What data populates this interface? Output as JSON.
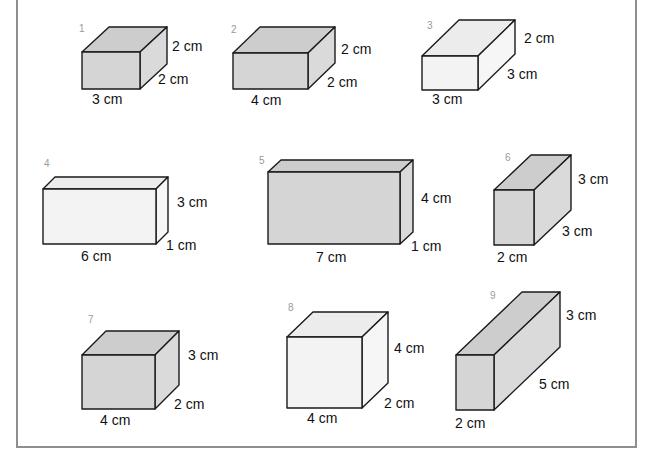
{
  "worksheet": {
    "colors": {
      "frame": "#8e8e8e",
      "edge": "#1a1a1a",
      "dark": {
        "front": "#d5d5d5",
        "top": "#cdcdcd",
        "side": "#dadada"
      },
      "light": {
        "front": "#f3f3f3",
        "top": "#ececec",
        "side": "#f6f6f6"
      }
    },
    "boxes": [
      {
        "number": "1",
        "shade": "dark",
        "front": [
          82,
          52,
          58,
          37
        ],
        "depth": [
          27,
          -25
        ],
        "num_pos": [
          79,
          32
        ],
        "labels": [
          {
            "text": "2 cm",
            "x": 172,
            "y": 51,
            "role": "height"
          },
          {
            "text": "2 cm",
            "x": 158,
            "y": 84,
            "role": "depth"
          },
          {
            "text": "3 cm",
            "x": 92,
            "y": 104,
            "role": "length"
          }
        ]
      },
      {
        "number": "2",
        "shade": "dark",
        "front": [
          233,
          53,
          75,
          36
        ],
        "depth": [
          27,
          -26
        ],
        "num_pos": [
          231,
          33
        ],
        "labels": [
          {
            "text": "2 cm",
            "x": 341,
            "y": 54,
            "role": "height"
          },
          {
            "text": "2 cm",
            "x": 327,
            "y": 87,
            "role": "depth"
          },
          {
            "text": "4 cm",
            "x": 251,
            "y": 105,
            "role": "length"
          }
        ]
      },
      {
        "number": "3",
        "shade": "light",
        "front": [
          422,
          56,
          56,
          34
        ],
        "depth": [
          37,
          -36
        ],
        "num_pos": [
          427,
          29
        ],
        "labels": [
          {
            "text": "2 cm",
            "x": 524,
            "y": 43,
            "role": "height"
          },
          {
            "text": "3 cm",
            "x": 507,
            "y": 79,
            "role": "depth"
          },
          {
            "text": "3 cm",
            "x": 432,
            "y": 104,
            "role": "length"
          }
        ]
      },
      {
        "number": "4",
        "shade": "light",
        "front": [
          43,
          189,
          113,
          55
        ],
        "depth": [
          12,
          -12
        ],
        "num_pos": [
          44,
          167
        ],
        "labels": [
          {
            "text": "3 cm",
            "x": 177,
            "y": 207,
            "role": "height"
          },
          {
            "text": "1 cm",
            "x": 166,
            "y": 250,
            "role": "depth"
          },
          {
            "text": "6 cm",
            "x": 81,
            "y": 261,
            "role": "length"
          }
        ]
      },
      {
        "number": "5",
        "shade": "dark",
        "front": [
          268,
          172,
          132,
          72
        ],
        "depth": [
          13,
          -12
        ],
        "num_pos": [
          259,
          164
        ],
        "labels": [
          {
            "text": "4 cm",
            "x": 421,
            "y": 203,
            "role": "height"
          },
          {
            "text": "1 cm",
            "x": 411,
            "y": 251,
            "role": "depth"
          },
          {
            "text": "7 cm",
            "x": 316,
            "y": 262,
            "role": "length"
          }
        ]
      },
      {
        "number": "6",
        "shade": "dark",
        "front": [
          494,
          190,
          40,
          55
        ],
        "depth": [
          37,
          -35
        ],
        "num_pos": [
          505,
          161
        ],
        "labels": [
          {
            "text": "3 cm",
            "x": 578,
            "y": 184,
            "role": "height"
          },
          {
            "text": "3 cm",
            "x": 562,
            "y": 236,
            "role": "depth"
          },
          {
            "text": "2 cm",
            "x": 497,
            "y": 262,
            "role": "length"
          }
        ]
      },
      {
        "number": "7",
        "shade": "dark",
        "front": [
          82,
          355,
          73,
          54
        ],
        "depth": [
          24,
          -24
        ],
        "num_pos": [
          88,
          323
        ],
        "labels": [
          {
            "text": "3 cm",
            "x": 188,
            "y": 360,
            "role": "height"
          },
          {
            "text": "2 cm",
            "x": 174,
            "y": 409,
            "role": "depth"
          },
          {
            "text": "4 cm",
            "x": 100,
            "y": 425,
            "role": "length"
          }
        ]
      },
      {
        "number": "8",
        "shade": "light",
        "front": [
          287,
          337,
          75,
          71
        ],
        "depth": [
          26,
          -25
        ],
        "num_pos": [
          288,
          311
        ],
        "labels": [
          {
            "text": "4 cm",
            "x": 394,
            "y": 353,
            "role": "height"
          },
          {
            "text": "2 cm",
            "x": 384,
            "y": 408,
            "role": "depth"
          },
          {
            "text": "4 cm",
            "x": 307,
            "y": 423,
            "role": "length"
          }
        ]
      },
      {
        "number": "9",
        "shade": "dark",
        "front": [
          456,
          355,
          38,
          55
        ],
        "depth": [
          66,
          -63
        ],
        "num_pos": [
          490,
          299
        ],
        "labels": [
          {
            "text": "3 cm",
            "x": 566,
            "y": 320,
            "role": "height"
          },
          {
            "text": "5 cm",
            "x": 539,
            "y": 389,
            "role": "depth"
          },
          {
            "text": "2 cm",
            "x": 455,
            "y": 428,
            "role": "length"
          }
        ]
      }
    ]
  }
}
